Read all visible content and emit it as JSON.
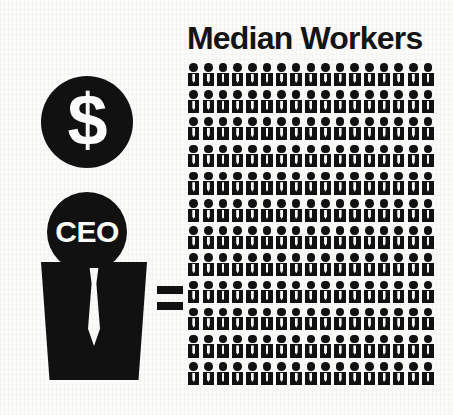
{
  "background_color": "#fbfbfa",
  "ink_color": "#111111",
  "infographic": {
    "topic": "CEO pay versus median worker pay",
    "ceo_side": {
      "dollar_symbol": "$",
      "dollar_icon_name": "dollar-coin-icon",
      "ceo_label": "CEO",
      "ceo_figure_name": "ceo-figure-icon",
      "tie_name": "necktie-shape"
    },
    "operator": {
      "symbol": "=",
      "name": "equals-sign"
    },
    "workers_side": {
      "title": "Median Workers",
      "grid": {
        "columns": 17,
        "rows": 12,
        "total_figures": 204,
        "figure_icon_name": "worker-person-icon"
      }
    }
  }
}
